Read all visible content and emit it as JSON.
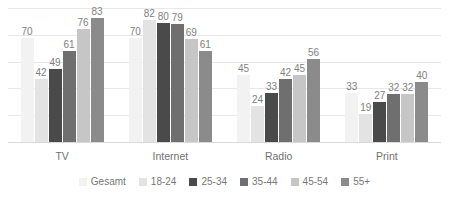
{
  "chart_data": {
    "type": "bar",
    "title": "",
    "subtitle": "",
    "xlabel": "",
    "ylabel": "",
    "ylim": [
      0,
      90
    ],
    "grid": true,
    "gridlines": [
      0,
      18,
      36,
      54,
      72,
      90
    ],
    "legend_position": "bottom",
    "categories": [
      "TV",
      "Internet",
      "Radio",
      "Print"
    ],
    "series": [
      {
        "name": "Gesamt",
        "color": "#f2f2f2",
        "values": [
          70,
          70,
          45,
          33
        ]
      },
      {
        "name": "18-24",
        "color": "#e3e3e3",
        "values": [
          42,
          82,
          24,
          19
        ]
      },
      {
        "name": "25-34",
        "color": "#4a4a4a",
        "values": [
          49,
          80,
          33,
          27
        ]
      },
      {
        "name": "35-44",
        "color": "#6f6f6f",
        "values": [
          61,
          79,
          42,
          32
        ]
      },
      {
        "name": "45-54",
        "color": "#c6c6c6",
        "values": [
          76,
          69,
          45,
          32
        ]
      },
      {
        "name": "55+",
        "color": "#8b8b8b",
        "values": [
          83,
          61,
          56,
          40
        ]
      }
    ]
  },
  "legend": {
    "items": [
      {
        "label": "Gesamt",
        "color": "#f2f2f2"
      },
      {
        "label": "18-24",
        "color": "#e3e3e3"
      },
      {
        "label": "25-34",
        "color": "#4a4a4a"
      },
      {
        "label": "35-44",
        "color": "#6f6f6f"
      },
      {
        "label": "45-54",
        "color": "#c6c6c6"
      },
      {
        "label": "55+",
        "color": "#8b8b8b"
      }
    ]
  },
  "colors": {
    "background": "#ffffff",
    "gridline": "#e8e8e8",
    "axis": "#d9d9d9",
    "label_text": "#808080",
    "category_text": "#707070",
    "legend_text": "#777777"
  }
}
